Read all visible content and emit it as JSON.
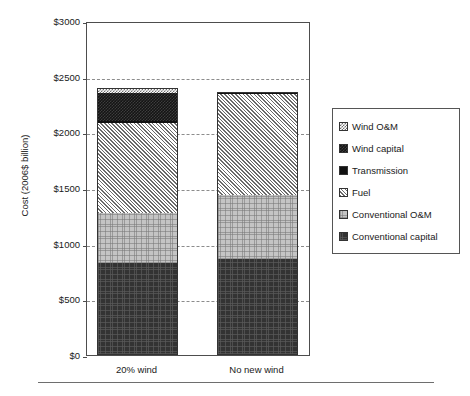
{
  "chart_data": {
    "type": "bar",
    "stacked": true,
    "title": "",
    "subtitle": "",
    "xlabel": "",
    "ylabel": "Cost (2006$ billion)",
    "categories": [
      "20% wind",
      "No new wind"
    ],
    "ylim": [
      0,
      3000
    ],
    "yticks": [
      0,
      500,
      1000,
      1500,
      2000,
      2500,
      3000
    ],
    "ytick_labels": [
      "$0",
      "$500",
      "$1000",
      "$1500",
      "$2000",
      "$2500",
      "$3000"
    ],
    "grid": true,
    "grid_axis": "y",
    "grid_style": "dashed",
    "legend_position": "right",
    "series": [
      {
        "name": "Conventional capital",
        "pattern": "conv-capital",
        "color": "#333333",
        "values": [
          830,
          860
        ]
      },
      {
        "name": "Conventional O&M",
        "pattern": "conv-om",
        "color": "#c4c4c4",
        "values": [
          450,
          575
        ]
      },
      {
        "name": "Fuel",
        "pattern": "fuel",
        "color": "#6b6b6b",
        "values": [
          800,
          910
        ]
      },
      {
        "name": "Transmission",
        "pattern": "transmission",
        "color": "#111111",
        "values": [
          20,
          15
        ]
      },
      {
        "name": "Wind capital",
        "pattern": "wind-capital",
        "color": "#141414",
        "values": [
          255,
          0
        ]
      },
      {
        "name": "Wind O&M",
        "pattern": "wind-om",
        "color": "#707070",
        "values": [
          45,
          0
        ]
      }
    ],
    "totals": [
      2400,
      2360
    ],
    "legend_entries": [
      "Wind O&M",
      "Wind capital",
      "Transmission",
      "Fuel",
      "Conventional O&M",
      "Conventional capital"
    ]
  },
  "legend": {
    "items": [
      {
        "label": "Wind O&M",
        "swatch": "wind-om"
      },
      {
        "label": "Wind capital",
        "swatch": "wind-capital"
      },
      {
        "label": "Transmission",
        "swatch": "transmission"
      },
      {
        "label": "Fuel",
        "swatch": "fuel"
      },
      {
        "label": "Conventional O&M",
        "swatch": "conv-om"
      },
      {
        "label": "Conventional capital",
        "swatch": "conv-capital"
      }
    ]
  }
}
